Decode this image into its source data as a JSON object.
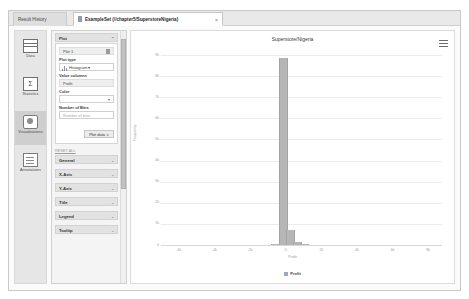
{
  "window": {
    "tabs": [
      {
        "id": "result-history",
        "label": "Result History",
        "active": false,
        "icon": "history-icon"
      },
      {
        "id": "exampleset",
        "label": "ExampleSet (//chapter5/SuperstoreNigeria)",
        "active": true,
        "icon": "table-icon",
        "close": "×"
      }
    ]
  },
  "sidebar": {
    "items": [
      {
        "id": "data",
        "label": "Data",
        "icon": "table-icon",
        "selected": false
      },
      {
        "id": "statistics",
        "label": "Statistics",
        "icon": "sigma-icon",
        "selected": false
      },
      {
        "id": "visualizations",
        "label": "Visualizations",
        "icon": "chart-icon",
        "selected": true
      },
      {
        "id": "annotations",
        "label": "Annotations",
        "icon": "notes-icon",
        "selected": false
      }
    ]
  },
  "panel": {
    "plot_section": {
      "label": "Plot",
      "chev": "⌃"
    },
    "plot_name": "Plot 1",
    "plot_type_label": "Plot type",
    "plot_type_value": "Histogram",
    "value_columns_label": "Value columns",
    "value_columns_value": "Profit",
    "color_label": "Color",
    "color_value": "",
    "bins_label": "Number of Bins",
    "bins_placeholder": "Number of bins",
    "bins_value": "",
    "plot_data_button": "Plot data",
    "reset_link": "RESET ALL",
    "sections": [
      {
        "id": "general",
        "label": "General",
        "chev": "⌄"
      },
      {
        "id": "x-axis",
        "label": "X-Axis",
        "chev": "⌄"
      },
      {
        "id": "y-axis",
        "label": "Y-Axis",
        "chev": "⌄"
      },
      {
        "id": "title",
        "label": "Title",
        "chev": "⌄"
      },
      {
        "id": "legend",
        "label": "Legend",
        "chev": "⌄"
      },
      {
        "id": "tooltip",
        "label": "Tooltip",
        "chev": "⌄"
      }
    ]
  },
  "chart_data": {
    "type": "bar",
    "title": "Superstore/Nigeria",
    "xlabel": "Profit",
    "ylabel": "Frequency",
    "legend": [
      "Profit"
    ],
    "legend_position": "bottom",
    "grid": true,
    "xlim": [
      -7000,
      9000
    ],
    "ylim": [
      0,
      9000
    ],
    "xticks": [
      "-6k",
      "-4k",
      "-2k",
      "0",
      "2k",
      "4k",
      "6k",
      "8k"
    ],
    "xtick_values": [
      -6000,
      -4000,
      -2000,
      0,
      2000,
      4000,
      6000,
      8000
    ],
    "yticks": [
      "9k",
      "8k",
      "7k",
      "6k",
      "5k",
      "4k",
      "3k",
      "2k",
      "1k",
      "0"
    ],
    "ytick_values": [
      9000,
      8000,
      7000,
      6000,
      5000,
      4000,
      3000,
      2000,
      1000,
      0
    ],
    "bar_color": "#b6b6b6",
    "bins": [
      {
        "center": -600,
        "count": 60
      },
      {
        "center": -200,
        "count": 8850
      },
      {
        "center": 200,
        "count": 700
      },
      {
        "center": 600,
        "count": 120
      },
      {
        "center": 1000,
        "count": 40
      }
    ]
  },
  "menu_icon": "hamburger-icon"
}
